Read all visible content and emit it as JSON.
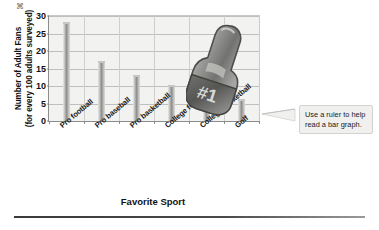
{
  "chart_data": {
    "type": "bar",
    "title": "",
    "xlabel": "Favorite Sport",
    "ylabel": "Number of Adult Fans (for every 100 adults surveyed)",
    "ylabel_line1": "Number of Adult Fans",
    "ylabel_line2": "(for every 100 adults surveyed)",
    "categories": [
      "Pro football",
      "Pro baseball",
      "Pro basketball",
      "College football",
      "College basketball",
      "Golf"
    ],
    "values": [
      28,
      17,
      13,
      10,
      6,
      6
    ],
    "ylim": [
      0,
      30
    ],
    "yticks": [
      0,
      5,
      10,
      15,
      20,
      25,
      30
    ],
    "ytick_labels": [
      "0",
      "5",
      "10",
      "15",
      "20",
      "25",
      "30"
    ],
    "grid": true,
    "legend": false,
    "bar_color": "#9d9d9b",
    "plot_background": "#f2f2f0",
    "axis_color": "#8c8c8c",
    "gridline_color": "#bfbfbd"
  },
  "annotation": {
    "callout_line1": "Use a ruler to help",
    "callout_line2": "read a bar graph.",
    "callout_text": "Use a ruler to help read a bar graph."
  },
  "decoration": {
    "foam_hand_text": "#1",
    "foam_hand_name": "foam-finger-number-one"
  }
}
